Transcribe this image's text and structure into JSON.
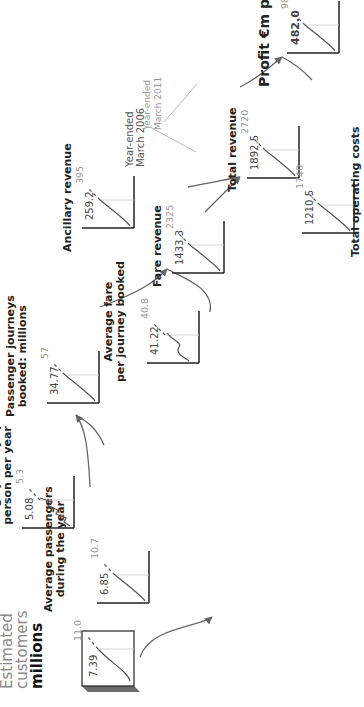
{
  "diagram": {
    "type": "value-driver tree",
    "orientation": "rotated 90° counter-clockwise",
    "legend": {
      "base_label": "Year-ended\nMarch 2006",
      "projection_label": "Year-ended\nMarch 2011"
    },
    "start": {
      "title_line1": "Estimated",
      "title_line2": "customers",
      "title_line3": "millions",
      "value": "7.39",
      "projection": "11.0"
    },
    "nodes": [
      {
        "id": "avg-passengers",
        "title": "Average passengers\nduring the year",
        "value": "6.85",
        "projection": "10.7"
      },
      {
        "id": "avg-journeys",
        "title": "Average journeys per\nperson per year",
        "value": "5.08",
        "projection": "5.3"
      },
      {
        "id": "passenger-journeys",
        "title": "Passenger journeys\nbooked: millions",
        "value": "34.77",
        "projection": "57"
      },
      {
        "id": "avg-fare",
        "title": "Average fare\nper journey booked",
        "value": "41.22",
        "projection": "40.8"
      },
      {
        "id": "fare-revenue",
        "title": "Fare revenue",
        "value": "1433.3",
        "projection": "2325"
      },
      {
        "id": "ancillary-revenue",
        "title": "Ancillary revenue",
        "value": "259.2",
        "projection": "395"
      },
      {
        "id": "total-revenue",
        "title": "Total revenue",
        "value": "1892.5",
        "projection": "2720"
      },
      {
        "id": "total-operating-costs",
        "title": "Total operating costs",
        "value": "1210.5",
        "projection": "1740"
      },
      {
        "id": "profit",
        "title": "Profit €m p.a.",
        "value": "482.0",
        "projection": "980"
      }
    ],
    "colors": {
      "line": "#555555",
      "axis": "#222222",
      "projection_text": "#999999",
      "guide": "#cccccc",
      "box_side": "#6b6b6b"
    }
  }
}
